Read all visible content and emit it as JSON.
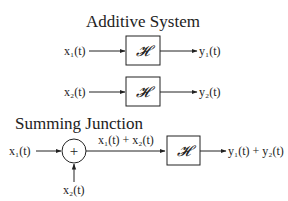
{
  "sections": {
    "additive": {
      "title": "Additive System",
      "row1": {
        "input": "x₁(t)",
        "block": "𝓗",
        "output": "y₁(t)"
      },
      "row2": {
        "input": "x₂(t)",
        "block": "𝓗",
        "output": "y₂(t)"
      }
    },
    "summing": {
      "title": "Summing Junction",
      "input1": "x₁(t)",
      "input2": "x₂(t)",
      "junction": "+",
      "sum_label": "x₁(t) + x₂(t)",
      "block": "𝓗",
      "output": "y₁(t) + y₂(t)"
    }
  }
}
